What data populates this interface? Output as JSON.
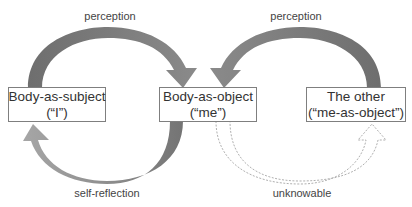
{
  "diagram": {
    "type": "flow",
    "nodes": [
      {
        "id": "subject",
        "title": "Body-as-subject",
        "subtitle": "(“I”)"
      },
      {
        "id": "object",
        "title": "Body-as-object",
        "subtitle": "(“me”)"
      },
      {
        "id": "other",
        "title": "The other",
        "subtitle": "(“me-as-object”)"
      }
    ],
    "edges": [
      {
        "from": "subject",
        "to": "object",
        "label": "perception",
        "style": "solid-dark"
      },
      {
        "from": "other",
        "to": "object",
        "label": "perception",
        "style": "solid-dark"
      },
      {
        "from": "object",
        "to": "subject",
        "label": "self-reflection",
        "style": "solid-light"
      },
      {
        "from": "object",
        "to": "other",
        "label": "unknowable",
        "style": "dashed-outline"
      }
    ],
    "colors": {
      "arrow_dark": "#7a7a7a",
      "arrow_light": "#a0a0a0",
      "dashed_outline": "#b0b0b0",
      "box_border": "#7f7f7f",
      "text": "#333333"
    }
  }
}
